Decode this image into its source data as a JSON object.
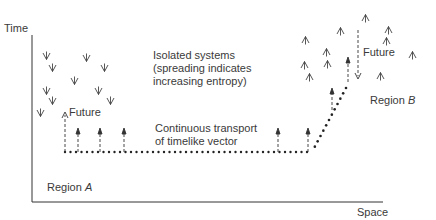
{
  "axes": {
    "y_label": "Time",
    "x_label": "Space"
  },
  "labels": {
    "isolated_systems": "Isolated systems\n(spreading indicates\nincreasing entropy)",
    "transport": "Continuous transport\nof timelike vector",
    "future_a": "Future",
    "future_b": "Future",
    "region_a_prefix": "Region ",
    "region_a_letter": "A",
    "region_b_prefix": "Region ",
    "region_b_letter": "B"
  },
  "colors": {
    "ink": "#333333",
    "background": "#ffffff"
  },
  "region_a_glyphs": {
    "symbol": "down-fork",
    "positions": [
      [
        46,
        55
      ],
      [
        52,
        67
      ],
      [
        86,
        57
      ],
      [
        104,
        67
      ],
      [
        74,
        80
      ],
      [
        46,
        90
      ],
      [
        98,
        90
      ],
      [
        52,
        100
      ],
      [
        110,
        100
      ],
      [
        40,
        112
      ]
    ]
  },
  "region_b_glyphs": {
    "symbol": "up-fork",
    "positions": [
      [
        365,
        18
      ],
      [
        340,
        31
      ],
      [
        388,
        30
      ],
      [
        305,
        40
      ],
      [
        386,
        41
      ],
      [
        326,
        52
      ],
      [
        304,
        65
      ],
      [
        327,
        64
      ],
      [
        412,
        55
      ],
      [
        309,
        77
      ],
      [
        380,
        76
      ]
    ]
  }
}
